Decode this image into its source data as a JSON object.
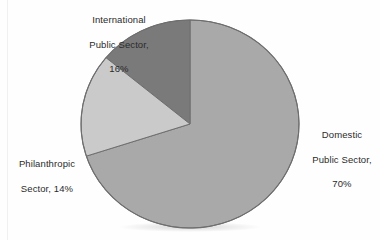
{
  "chart_data": {
    "type": "pie",
    "title": "",
    "categories": [
      "Domestic Public Sector",
      "International Public Sector",
      "Philanthropic Sector"
    ],
    "values": [
      70,
      16,
      14
    ],
    "unit": "%",
    "start_angle_deg": 0,
    "direction": "clockwise",
    "legend": "none",
    "grid": false,
    "slices": [
      {
        "name": "Domestic Public Sector",
        "value": 70,
        "value_label": "70%",
        "color": "#a9a9a9",
        "label_lines": [
          "Domestic",
          "Public Sector,",
          "70%"
        ],
        "label_position": "right"
      },
      {
        "name": "International Public Sector",
        "value": 16,
        "value_label": "16%",
        "color": "#cacaca",
        "label_lines": [
          "International",
          "Public Sector,",
          "16%"
        ],
        "label_position": "top-left"
      },
      {
        "name": "Philanthropic Sector",
        "value": 14,
        "value_label": "14%",
        "color": "#7a7a7a",
        "label_lines": [
          "Philanthropic",
          "Sector, 14%"
        ],
        "label_position": "left"
      }
    ]
  },
  "labels": {
    "international": {
      "line1": "International",
      "line2": "Public Sector,",
      "line3": "16%"
    },
    "domestic": {
      "line1": "Domestic",
      "line2": "Public Sector,",
      "line3": "70%"
    },
    "philanthropic": {
      "line1": "Philanthropic",
      "line2": "Sector, 14%"
    }
  },
  "colors": {
    "background": "#fefefe",
    "outline": "#6e6e6e",
    "text": "#2b2b2b",
    "domestic": "#a9a9a9",
    "international": "#cacaca",
    "philanthropic": "#7a7a7a"
  },
  "geometry": {
    "center_x": 190,
    "center_y": 124,
    "radius_x": 109,
    "radius_y": 104
  }
}
